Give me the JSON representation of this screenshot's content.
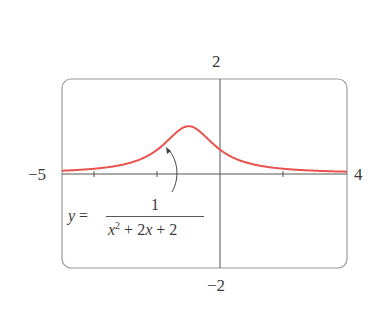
{
  "chart_data": {
    "type": "line",
    "title": "",
    "xlabel": "",
    "ylabel": "",
    "xlim": [
      -5,
      4
    ],
    "ylim": [
      -2,
      2
    ],
    "grid": false,
    "x_ticks": [
      -4,
      -2,
      2
    ],
    "axis_end_labels": {
      "x_min": "−5",
      "x_max": "4",
      "y_max": "2",
      "y_min": "−2"
    },
    "series": [
      {
        "name": "y = 1/(x^2 + 2x + 2)",
        "color": "#e8534f",
        "x": [
          -5,
          -4,
          -3,
          -2.5,
          -2,
          -1.5,
          -1,
          -0.5,
          0,
          0.5,
          1,
          2,
          3,
          4
        ],
        "y": [
          0.0588,
          0.1,
          0.2,
          0.3077,
          0.5,
          0.8,
          1.0,
          0.8,
          0.5,
          0.3077,
          0.2,
          0.1,
          0.0588,
          0.0385
        ]
      }
    ],
    "annotations": [
      {
        "text": "y = 1 / (x² + 2x + 2)",
        "arrow_to": [
          -1.4,
          0.55
        ]
      }
    ]
  },
  "labels": {
    "y_max": "2",
    "y_min": "−2",
    "x_min": "−5",
    "x_max": "4",
    "eq_lhs": "y =",
    "eq_num": "1",
    "eq_den_x": "x",
    "eq_den_sup": "2",
    "eq_den_rest": " + 2",
    "eq_den_x2": "x",
    "eq_den_tail": " + 2"
  }
}
